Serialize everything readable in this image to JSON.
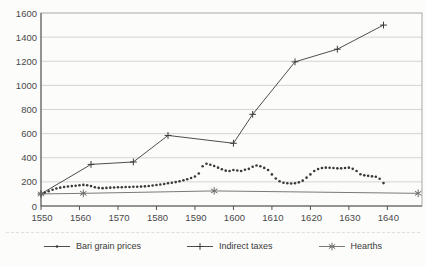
{
  "figure": {
    "background": "#fcfcfb",
    "colors": {
      "series_line": "#3a3a3a",
      "hearths_line": "#6a6a6a",
      "grid": "#d4d4d4",
      "box_border": "#a8a8a8",
      "axis": "#555555",
      "tick_text": "#4a4a4a",
      "legend_text": "#3a3a3a"
    }
  },
  "chart_data": {
    "type": "line",
    "title": "",
    "xlabel": "",
    "ylabel": "",
    "xlim": [
      1550,
      1649
    ],
    "ylim": [
      0,
      1600
    ],
    "xticks": [
      1550,
      1560,
      1570,
      1580,
      1590,
      1600,
      1610,
      1620,
      1630,
      1640
    ],
    "yticks": [
      0,
      200,
      400,
      600,
      800,
      1000,
      1200,
      1400,
      1600
    ],
    "grid": "horizontal",
    "legend_position": "bottom",
    "series": [
      {
        "name": "Bari grain prices",
        "marker": "dot",
        "line": false,
        "x": [
          1550,
          1551,
          1552,
          1553,
          1554,
          1555,
          1556,
          1557,
          1558,
          1559,
          1560,
          1561,
          1562,
          1563,
          1564,
          1565,
          1566,
          1567,
          1568,
          1569,
          1570,
          1571,
          1572,
          1573,
          1574,
          1575,
          1576,
          1577,
          1578,
          1579,
          1580,
          1581,
          1582,
          1583,
          1584,
          1585,
          1586,
          1587,
          1588,
          1589,
          1590,
          1591,
          1592,
          1593,
          1594,
          1595,
          1596,
          1597,
          1598,
          1599,
          1600,
          1601,
          1602,
          1603,
          1604,
          1605,
          1606,
          1607,
          1608,
          1609,
          1610,
          1611,
          1612,
          1613,
          1614,
          1615,
          1616,
          1617,
          1618,
          1619,
          1620,
          1621,
          1622,
          1623,
          1624,
          1625,
          1626,
          1627,
          1628,
          1629,
          1630,
          1631,
          1632,
          1633,
          1634,
          1635,
          1636,
          1637,
          1638,
          1639
        ],
        "values": [
          100,
          110,
          122,
          135,
          145,
          152,
          158,
          162,
          165,
          168,
          172,
          175,
          172,
          165,
          156,
          150,
          148,
          150,
          152,
          153,
          155,
          156,
          157,
          158,
          159,
          160,
          161,
          163,
          166,
          170,
          174,
          178,
          183,
          188,
          193,
          198,
          205,
          213,
          222,
          232,
          245,
          270,
          330,
          350,
          342,
          332,
          318,
          305,
          293,
          290,
          298,
          294,
          290,
          300,
          308,
          325,
          336,
          330,
          316,
          298,
          262,
          228,
          205,
          193,
          188,
          186,
          189,
          196,
          210,
          235,
          262,
          290,
          306,
          315,
          318,
          317,
          315,
          312,
          312,
          315,
          318,
          308,
          290,
          263,
          254,
          250,
          246,
          242,
          226,
          190
        ]
      },
      {
        "name": "Indirect taxes",
        "marker": "plus",
        "line": true,
        "x": [
          1550,
          1563,
          1574,
          1583,
          1600,
          1605,
          1616,
          1627,
          1639
        ],
        "values": [
          100,
          345,
          365,
          585,
          520,
          760,
          1195,
          1300,
          1500
        ]
      },
      {
        "name": "Hearths",
        "marker": "asterisk",
        "line": true,
        "x": [
          1550,
          1561,
          1595,
          1648
        ],
        "values": [
          100,
          105,
          125,
          105
        ]
      }
    ]
  }
}
